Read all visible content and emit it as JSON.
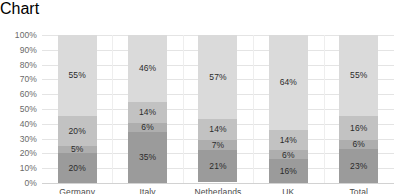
{
  "chart_data": {
    "type": "bar",
    "stacked": true,
    "normalized_percent": true,
    "title": "",
    "subtitle": "",
    "xlabel": "",
    "ylabel": "",
    "categories": [
      "Germany",
      "Italy",
      "Netherlands",
      "UK",
      "Total"
    ],
    "series": [
      {
        "name": "series-1",
        "color": "#9b9b9b",
        "values": [
          20,
          35,
          21,
          16,
          23
        ],
        "labels": [
          "20%",
          "35%",
          "21%",
          "16%",
          "23%"
        ]
      },
      {
        "name": "series-2",
        "color": "#aeaeae",
        "values": [
          5,
          6,
          7,
          6,
          6
        ],
        "labels": [
          "5%",
          "6%",
          "7%",
          "6%",
          "6%"
        ]
      },
      {
        "name": "series-3",
        "color": "#c2c2c2",
        "values": [
          20,
          14,
          14,
          14,
          16
        ],
        "labels": [
          "20%",
          "14%",
          "14%",
          "14%",
          "16%"
        ]
      },
      {
        "name": "series-4",
        "color": "#dadada",
        "values": [
          55,
          46,
          57,
          64,
          55
        ],
        "labels": [
          "55%",
          "46%",
          "57%",
          "64%",
          "55%"
        ]
      }
    ],
    "ylim": [
      0,
      100
    ],
    "ytick_labels": [
      "100%",
      "90%",
      "80%",
      "70%",
      "60%",
      "50%",
      "40%",
      "30%",
      "20%",
      "10%",
      "0%"
    ],
    "ytick_values": [
      100,
      90,
      80,
      70,
      60,
      50,
      40,
      30,
      20,
      10,
      0
    ],
    "grid": true,
    "legend": false,
    "legend_position": "none",
    "annotations": [],
    "colors": {
      "gridline": "#e4e4e4",
      "axis": "#d2d2d2",
      "tick_text": "#6a6a6a",
      "category_text": "#4a4a4a",
      "data_label_text": "#2b2b2b",
      "background": "#ffffff"
    }
  }
}
